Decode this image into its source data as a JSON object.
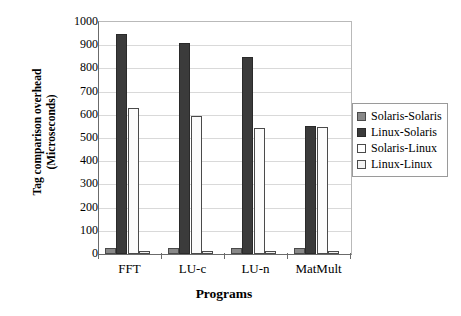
{
  "chart_data": {
    "type": "bar",
    "title": "",
    "xlabel": "Programs",
    "ylabel": "Tag comparison overhead (Microseconds)",
    "ylabel_line1": "Tag comparison overhead",
    "ylabel_line2": "(Microseconds)",
    "categories": [
      "FFT",
      "LU-c",
      "LU-n",
      "MatMult"
    ],
    "ylim": [
      0,
      1000
    ],
    "yticks": [
      0,
      100,
      200,
      300,
      400,
      500,
      600,
      700,
      800,
      900,
      1000
    ],
    "ytick_labels": [
      "0",
      "100",
      "200",
      "300",
      "400",
      "500",
      "600",
      "700",
      "800",
      "900",
      "1000"
    ],
    "grid": true,
    "grid_axis": "y",
    "legend_position": "right",
    "series": [
      {
        "name": "Solaris-Solaris",
        "color": "#888888",
        "values": [
          28,
          28,
          28,
          26
        ]
      },
      {
        "name": "Linux-Solaris",
        "color": "#3b3b3b",
        "values": [
          950,
          910,
          850,
          550
        ]
      },
      {
        "name": "Solaris-Linux",
        "color": "#ffffff",
        "values": [
          630,
          595,
          545,
          548
        ]
      },
      {
        "name": "Linux-Linux",
        "color": "#f2f2f2",
        "values": [
          14,
          14,
          12,
          12
        ]
      }
    ]
  },
  "legend": {
    "items": [
      {
        "label": "Solaris-Solaris",
        "swatch_class": "s-s"
      },
      {
        "label": "Linux-Solaris",
        "swatch_class": "l-s"
      },
      {
        "label": "Solaris-Linux",
        "swatch_class": "s-l"
      },
      {
        "label": "Linux-Linux",
        "swatch_class": "l-l"
      }
    ]
  }
}
